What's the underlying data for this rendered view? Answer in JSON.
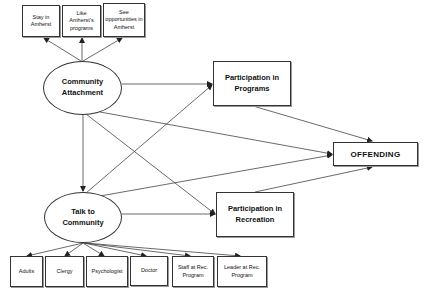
{
  "diagram": {
    "indicators_top": [
      {
        "label": "Stay in\nAmherst"
      },
      {
        "label": "Like Amherst's\nprograms"
      },
      {
        "label": "See\nopportunities in\nAmherst"
      }
    ],
    "latent": {
      "community_attachment": "Community\nAttachment",
      "talk_to_community": "Talk to\nCommunity"
    },
    "mediators": {
      "programs": "Participation in\nPrograms",
      "recreation": "Participation in\nRecreation"
    },
    "outcome": "OFFENDING",
    "indicators_bottom": [
      {
        "label": "Adults"
      },
      {
        "label": "Clergy"
      },
      {
        "label": "Psychologist"
      },
      {
        "label": "Doctor"
      },
      {
        "label": "Staff at Rec.\nProgram"
      },
      {
        "label": "Leader at Rec.\nProgram"
      }
    ],
    "edges": [
      {
        "from": "Community Attachment",
        "to": "Stay in Amherst"
      },
      {
        "from": "Community Attachment",
        "to": "Like Amherst's programs"
      },
      {
        "from": "Community Attachment",
        "to": "See opportunities in Amherst"
      },
      {
        "from": "Community Attachment",
        "to": "Participation in Programs"
      },
      {
        "from": "Community Attachment",
        "to": "Talk to Community"
      },
      {
        "from": "Community Attachment",
        "to": "Participation in Recreation"
      },
      {
        "from": "Community Attachment",
        "to": "OFFENDING"
      },
      {
        "from": "Talk to Community",
        "to": "Participation in Programs"
      },
      {
        "from": "Talk to Community",
        "to": "Participation in Recreation"
      },
      {
        "from": "Talk to Community",
        "to": "OFFENDING"
      },
      {
        "from": "Participation in Programs",
        "to": "OFFENDING"
      },
      {
        "from": "Participation in Recreation",
        "to": "OFFENDING"
      },
      {
        "from": "Talk to Community",
        "to": "Adults"
      },
      {
        "from": "Talk to Community",
        "to": "Clergy"
      },
      {
        "from": "Talk to Community",
        "to": "Psychologist"
      },
      {
        "from": "Talk to Community",
        "to": "Doctor"
      },
      {
        "from": "Talk to Community",
        "to": "Staff at Rec. Program"
      },
      {
        "from": "Talk to Community",
        "to": "Leader at Rec. Program"
      }
    ],
    "colors": {
      "line": "#333333",
      "background": "#ffffff"
    }
  }
}
